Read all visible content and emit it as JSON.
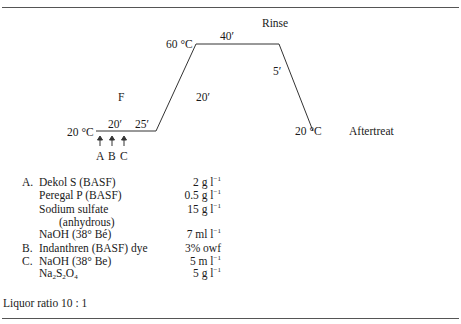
{
  "diagram": {
    "labels": {
      "start_temp": "20 °C",
      "peak_temp": "60 °C",
      "end_temp": "20 °C",
      "phase_f": "F",
      "phase_rinse": "Rinse",
      "phase_aftertreat": "Aftertreat",
      "time_a_b": "20′",
      "time_b_c": "25′",
      "time_ramp_up": "20′",
      "time_hold": "40′",
      "time_cool": "5′",
      "addition_a": "A",
      "addition_b": "B",
      "addition_c": "C"
    },
    "profile_points": [
      [
        96,
        131
      ],
      [
        156,
        131
      ],
      [
        196,
        44
      ],
      [
        279,
        44
      ],
      [
        313,
        131
      ]
    ],
    "line_color": "#333333"
  },
  "recipe": {
    "rows": [
      {
        "letter": "A.",
        "name": "Dekol S (BASF)",
        "value": "2 g l",
        "unit_sup": "−1"
      },
      {
        "letter": "",
        "name": "Peregal P (BASF)",
        "value": "0.5 g l",
        "unit_sup": "−1"
      },
      {
        "letter": "",
        "name": "Sodium sulfate",
        "value": "15 g l",
        "unit_sup": "−1"
      },
      {
        "letter": "",
        "name": "(anhydrous)",
        "value": "",
        "unit_sup": ""
      },
      {
        "letter": "",
        "name": "NaOH (38° Bé)",
        "value": "7 ml l",
        "unit_sup": "−1"
      },
      {
        "letter": "B.",
        "name": "Indanthren (BASF) dye",
        "value": "3% owf",
        "unit_sup": ""
      },
      {
        "letter": "C.",
        "name": "NaOH (38° Be)",
        "value": "5 m l",
        "unit_sup": "−1"
      },
      {
        "letter": "",
        "name_parts": [
          "Na",
          "2",
          "S",
          "2",
          "O",
          "4"
        ],
        "value": "5 g l",
        "unit_sup": "−1"
      }
    ]
  },
  "footer": {
    "liquor_ratio": "Liquor ratio 10 : 1"
  }
}
